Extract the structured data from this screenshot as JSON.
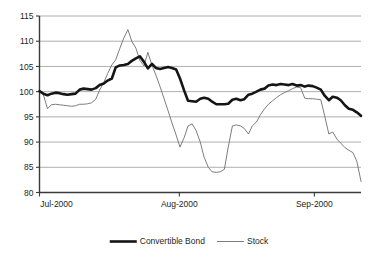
{
  "chart_data": {
    "type": "line",
    "title": "",
    "subtitle": "",
    "xlabel": "",
    "ylabel": "",
    "ylim": [
      80,
      115
    ],
    "yticks": [
      80,
      85,
      90,
      95,
      100,
      105,
      110,
      115
    ],
    "ytick_labels": [
      "80",
      "85",
      "90",
      "95",
      "100",
      "105",
      "110",
      "115"
    ],
    "xtick_labels": [
      "Jul-2000",
      "Aug-2000",
      "Sep-2000"
    ],
    "xtick_positions": [
      0,
      0.435,
      0.855
    ],
    "xlim": [
      0,
      1
    ],
    "grid": "horizontal",
    "legend_position": "bottom-center",
    "legend": [
      "Convertible Bond",
      "Stock"
    ],
    "colors": {
      "convertible_bond": "#151515",
      "stock": "#6e6e6e",
      "gridline": "#9a9a9a",
      "axis": "#3a3a3a",
      "background": "#ffffff",
      "text": "#231f20"
    },
    "series": [
      {
        "name": "Convertible Bond",
        "style": "thick-black",
        "x": [
          0.0,
          0.012,
          0.025,
          0.037,
          0.05,
          0.062,
          0.075,
          0.087,
          0.1,
          0.112,
          0.125,
          0.137,
          0.15,
          0.162,
          0.175,
          0.187,
          0.2,
          0.212,
          0.225,
          0.237,
          0.25,
          0.262,
          0.275,
          0.287,
          0.3,
          0.312,
          0.325,
          0.337,
          0.35,
          0.362,
          0.375,
          0.387,
          0.4,
          0.412,
          0.425,
          0.437,
          0.45,
          0.462,
          0.475,
          0.487,
          0.5,
          0.512,
          0.525,
          0.537,
          0.55,
          0.562,
          0.575,
          0.587,
          0.6,
          0.612,
          0.625,
          0.637,
          0.65,
          0.662,
          0.675,
          0.687,
          0.7,
          0.712,
          0.725,
          0.737,
          0.75,
          0.762,
          0.775,
          0.787,
          0.8,
          0.812,
          0.825,
          0.837,
          0.85,
          0.862,
          0.875,
          0.887,
          0.9,
          0.912,
          0.925,
          0.937,
          0.95,
          0.962,
          0.975,
          0.987,
          1.0
        ],
        "values": [
          100.1,
          99.6,
          99.3,
          99.6,
          99.8,
          99.7,
          99.5,
          99.4,
          99.5,
          99.6,
          100.4,
          100.6,
          100.5,
          100.4,
          100.7,
          101.3,
          101.6,
          102.2,
          102.6,
          104.8,
          105.2,
          105.3,
          105.5,
          106.1,
          106.6,
          107.0,
          105.9,
          104.6,
          105.5,
          104.7,
          104.5,
          104.7,
          104.9,
          104.7,
          104.4,
          102.6,
          100.2,
          98.2,
          98.1,
          98.0,
          98.6,
          98.8,
          98.6,
          98.0,
          97.5,
          97.5,
          97.5,
          97.6,
          98.4,
          98.6,
          98.3,
          98.5,
          99.4,
          99.6,
          100.0,
          100.4,
          100.6,
          101.2,
          101.4,
          101.3,
          101.5,
          101.4,
          101.3,
          101.5,
          101.2,
          101.3,
          101.0,
          101.2,
          101.1,
          100.8,
          100.4,
          99.2,
          98.3,
          99.0,
          98.8,
          98.3,
          97.3,
          96.6,
          96.4,
          95.9,
          95.2
        ]
      },
      {
        "name": "Stock",
        "style": "thin-gray",
        "x": [
          0.0,
          0.012,
          0.025,
          0.037,
          0.05,
          0.062,
          0.075,
          0.087,
          0.1,
          0.112,
          0.125,
          0.137,
          0.15,
          0.162,
          0.175,
          0.187,
          0.2,
          0.212,
          0.225,
          0.237,
          0.25,
          0.262,
          0.275,
          0.287,
          0.3,
          0.312,
          0.325,
          0.337,
          0.35,
          0.362,
          0.375,
          0.387,
          0.4,
          0.412,
          0.425,
          0.437,
          0.45,
          0.462,
          0.475,
          0.487,
          0.5,
          0.512,
          0.525,
          0.537,
          0.55,
          0.562,
          0.575,
          0.587,
          0.6,
          0.612,
          0.625,
          0.637,
          0.65,
          0.662,
          0.675,
          0.687,
          0.7,
          0.712,
          0.725,
          0.737,
          0.75,
          0.762,
          0.775,
          0.787,
          0.8,
          0.812,
          0.825,
          0.837,
          0.85,
          0.862,
          0.875,
          0.887,
          0.9,
          0.912,
          0.925,
          0.937,
          0.95,
          0.962,
          0.975,
          0.987,
          1.0
        ],
        "values": [
          100.2,
          99.4,
          96.6,
          97.4,
          97.5,
          97.4,
          97.3,
          97.2,
          97.1,
          97.2,
          97.5,
          97.5,
          97.6,
          97.8,
          98.5,
          100.3,
          101.8,
          103.6,
          105.3,
          106.3,
          108.6,
          110.6,
          112.3,
          110.0,
          108.6,
          106.2,
          105.1,
          107.8,
          105.2,
          103.3,
          101.0,
          98.7,
          96.2,
          93.8,
          91.4,
          89.0,
          90.9,
          93.2,
          93.6,
          92.3,
          90.0,
          87.0,
          85.0,
          84.1,
          84.0,
          84.1,
          84.6,
          89.0,
          93.2,
          93.4,
          93.2,
          92.7,
          91.6,
          93.2,
          94.0,
          95.4,
          96.6,
          97.5,
          98.2,
          98.8,
          99.4,
          99.8,
          100.2,
          100.6,
          100.9,
          100.8,
          98.7,
          98.6,
          98.6,
          98.5,
          98.4,
          95.2,
          91.6,
          92.0,
          90.6,
          89.8,
          88.9,
          88.4,
          87.9,
          86.2,
          82.2
        ]
      }
    ]
  },
  "legend": {
    "items": [
      {
        "label": "Convertible Bond",
        "series_key": "convertible_bond"
      },
      {
        "label": "Stock",
        "series_key": "stock"
      }
    ]
  },
  "axis": {
    "y_labels": [
      "115",
      "110",
      "105",
      "100",
      "95",
      "90",
      "85",
      "80"
    ],
    "x_labels": [
      "Jul-2000",
      "Aug-2000",
      "Sep-2000"
    ]
  }
}
